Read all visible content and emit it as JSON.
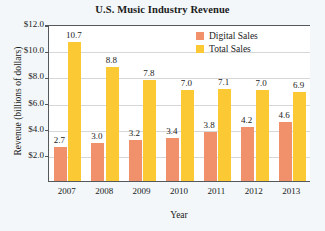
{
  "chart_data": {
    "type": "bar",
    "title": "U.S. Music Industry Revenue",
    "xlabel": "Year",
    "ylabel": "Revenue (billions of dollars)",
    "categories": [
      "2007",
      "2008",
      "2009",
      "2010",
      "2011",
      "2012",
      "2013"
    ],
    "series": [
      {
        "name": "Digital Sales",
        "color": "#f0916b",
        "values": [
          2.7,
          3.0,
          3.2,
          3.4,
          3.8,
          4.2,
          4.6
        ],
        "labels": [
          "2.7",
          "3.0",
          "3.2",
          "3.4",
          "3.8",
          "4.2",
          "4.6"
        ]
      },
      {
        "name": "Total Sales",
        "color": "#fbc933",
        "values": [
          10.7,
          8.8,
          7.8,
          7.0,
          7.1,
          7.0,
          6.9
        ],
        "labels": [
          "10.7",
          "8.8",
          "7.8",
          "7.0",
          "7.1",
          "7.0",
          "6.9"
        ]
      }
    ],
    "ylim": [
      0,
      12
    ],
    "ytick_values": [
      2,
      4,
      6,
      8,
      10,
      12
    ],
    "ytick_labels": [
      "$2.0",
      "$4.0",
      "$6.0",
      "$8.0",
      "$10.0",
      "$12.0"
    ],
    "grid": true,
    "legend_position": "top-right"
  },
  "legend": {
    "entries": [
      {
        "label": "Digital Sales",
        "color": "#f0916b"
      },
      {
        "label": "Total Sales",
        "color": "#fbc933"
      }
    ]
  }
}
